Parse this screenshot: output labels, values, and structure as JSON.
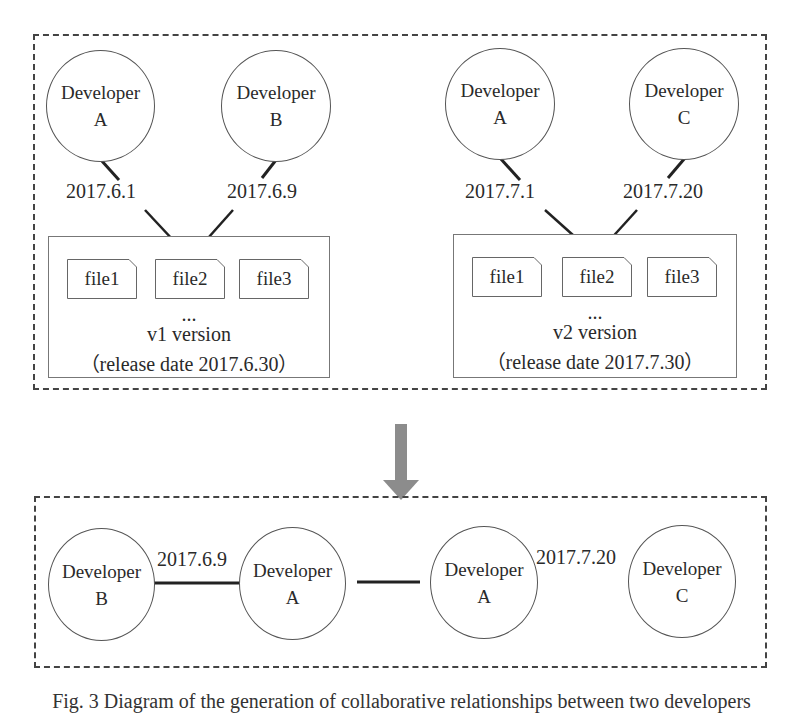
{
  "top_panel": {
    "groups": [
      {
        "developers": [
          {
            "label_line1": "Developer",
            "label_line2": "A"
          },
          {
            "label_line1": "Developer",
            "label_line2": "B"
          }
        ],
        "commit_dates": [
          "2017.6.1",
          "2017.6.9"
        ],
        "files": [
          "file1",
          "file2",
          "file3"
        ],
        "ellipsis": "...",
        "version_label": "v1 version",
        "release_label": "（release date 2017.6.30）"
      },
      {
        "developers": [
          {
            "label_line1": "Developer",
            "label_line2": "A"
          },
          {
            "label_line1": "Developer",
            "label_line2": "C"
          }
        ],
        "commit_dates": [
          "2017.7.1",
          "2017.7.20"
        ],
        "files": [
          "file1",
          "file2",
          "file3"
        ],
        "ellipsis": "...",
        "version_label": "v2 version",
        "release_label": "（release date 2017.7.30）"
      }
    ]
  },
  "transition_arrow": {
    "icon": "down-arrow-icon",
    "color": "#8c8c8c"
  },
  "bottom_panel": {
    "edges": [
      {
        "left": {
          "label_line1": "Developer",
          "label_line2": "B"
        },
        "right": {
          "label_line1": "Developer",
          "label_line2": "A"
        },
        "edge_label": "2017.6.9"
      },
      {
        "left": {
          "label_line1": "Developer",
          "label_line2": "A"
        },
        "right": {
          "label_line1": "Developer",
          "label_line2": "C"
        },
        "edge_label": "2017.7.20"
      }
    ]
  },
  "caption": "Fig. 3  Diagram of the generation of collaborative relationships between two developers"
}
